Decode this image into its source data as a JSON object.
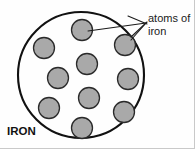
{
  "figure": {
    "background_color": "#fefefe",
    "outline_color": "#111111",
    "atom_fill_color": "#a9a9a9",
    "atom_stroke_color": "#2a2a2a",
    "leader_color": "#1a1a1a",
    "text_color": "#1a1a1a"
  },
  "labels": {
    "callout_line1": "atoms of",
    "callout_line2": "iron",
    "material_label": "IRON"
  },
  "container": {
    "shape": "circle",
    "center_x": 81,
    "center_y": 75,
    "radius": 63,
    "stroke_width": 2.1
  },
  "atoms": {
    "count": 10,
    "radius": 10.5,
    "positions": [
      {
        "name": "atom-top-center",
        "cx": 82,
        "cy": 30
      },
      {
        "name": "atom-upper-left",
        "cx": 44,
        "cy": 48
      },
      {
        "name": "atom-upper-right",
        "cx": 125,
        "cy": 45
      },
      {
        "name": "atom-mid-center",
        "cx": 87,
        "cy": 64
      },
      {
        "name": "atom-mid-left",
        "cx": 58,
        "cy": 78
      },
      {
        "name": "atom-mid-right",
        "cx": 128,
        "cy": 79
      },
      {
        "name": "atom-lower-center",
        "cx": 89,
        "cy": 98
      },
      {
        "name": "atom-lower-left",
        "cx": 49,
        "cy": 108
      },
      {
        "name": "atom-lower-right",
        "cx": 124,
        "cy": 112
      },
      {
        "name": "atom-bottom-center",
        "cx": 82,
        "cy": 128
      }
    ]
  },
  "leaders": {
    "origin_x": 146,
    "origin_y": 23,
    "line_a": {
      "x1": 146,
      "y1": 23,
      "x2": 88,
      "y2": 31
    },
    "line_b": {
      "x1": 146,
      "y1": 23,
      "x2": 131,
      "y2": 40
    },
    "arrow_a": {
      "x1": 128,
      "y1": 17,
      "x2": 146,
      "y2": 23
    },
    "arrow_b": {
      "x1": 132,
      "y1": 36,
      "x2": 146,
      "y2": 23
    }
  },
  "text_positions": {
    "callout_x": 148,
    "callout_y1": 22,
    "callout_y2": 35,
    "material_x": 7,
    "material_y": 135
  }
}
